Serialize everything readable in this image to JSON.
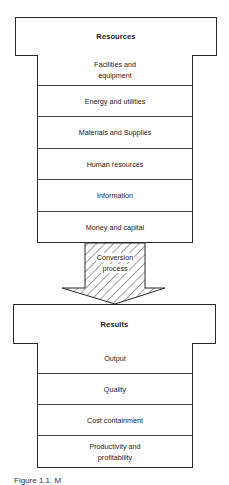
{
  "diagram": {
    "resources": {
      "title": "Resources",
      "items": [
        {
          "label": "Facilities and equipment"
        },
        {
          "label": "Energy and utilities"
        },
        {
          "label": "Materials and Supplies"
        },
        {
          "label": "Human resources"
        },
        {
          "label": "Information"
        },
        {
          "label": "Money and capital"
        }
      ]
    },
    "conversion": {
      "label_line1": "Conversion",
      "label_line2": "process",
      "fill_pattern": "diagonal-hatch"
    },
    "results": {
      "title": "Results",
      "items": [
        {
          "label": "Output"
        },
        {
          "label": "Quality"
        },
        {
          "label": "Cost containment"
        },
        {
          "label": "Productivity and profitability"
        }
      ]
    },
    "caption": "Figure 1.1. M"
  },
  "colors": {
    "line": "#2a2a2a",
    "text": "#1c1c1c",
    "background": "#ffffff"
  }
}
